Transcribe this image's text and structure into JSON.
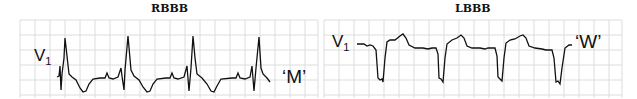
{
  "panels": [
    {
      "title": "RBBB",
      "lead_label": "V",
      "lead_sub": "1",
      "pattern_label": "‘M’"
    },
    {
      "title": "LBBB",
      "lead_label": "V",
      "lead_sub": "1",
      "pattern_label": "‘W’"
    }
  ],
  "colors": {
    "grid": "#d8d8d8",
    "trace": "#111111"
  }
}
